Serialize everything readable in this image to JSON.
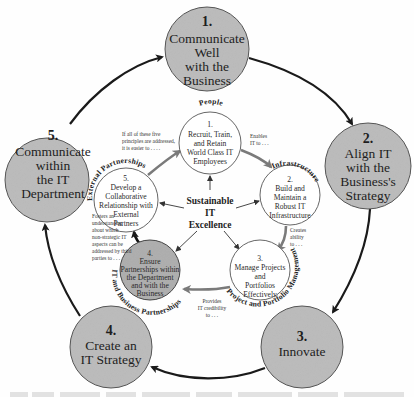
{
  "diagram": {
    "center": {
      "lines": [
        "Sustainable",
        "IT",
        "Excellence"
      ]
    },
    "outer_cycle": [
      {
        "number": "1.",
        "lines": [
          "Communicate",
          "Well",
          "with the",
          "Business"
        ]
      },
      {
        "number": "2.",
        "lines": [
          "Align IT",
          "with the",
          "Business's",
          "Strategy"
        ]
      },
      {
        "number": "3.",
        "lines": [
          "Innovate"
        ]
      },
      {
        "number": "4.",
        "lines": [
          "Create an",
          "IT Strategy"
        ]
      },
      {
        "number": "5.",
        "lines": [
          "Communicate",
          "within",
          "the IT",
          "Department"
        ]
      }
    ],
    "inner_cycle": [
      {
        "number": "1.",
        "lines": [
          "Recruit, Train,",
          "and Retain",
          "World Class IT",
          "Employees"
        ],
        "category": "People"
      },
      {
        "number": "2.",
        "lines": [
          "Build and",
          "Maintain a",
          "Robust IT",
          "Infrastructure"
        ],
        "category": "Infrastructure"
      },
      {
        "number": "3.",
        "lines": [
          "Manage Projects",
          "and",
          "Portfolios",
          "Effectively"
        ],
        "category": "Project and Portfolio Management"
      },
      {
        "number": "4.",
        "lines": [
          "Ensure",
          "Partnerships within",
          "the Department",
          "and with the",
          "Business"
        ],
        "category": "IT and Business Partnerships",
        "highlighted": true
      },
      {
        "number": "5.",
        "lines": [
          "Develop a",
          "Collaborative",
          "Relationship with",
          "External",
          "Partners"
        ],
        "category": "External Partnerships"
      }
    ],
    "connector_notes": [
      {
        "from": "1",
        "to": "2",
        "lines": [
          "Enables",
          "IT to . . ."
        ]
      },
      {
        "from": "2",
        "to": "3",
        "lines": [
          "Creates",
          "ability",
          "to . . ."
        ]
      },
      {
        "from": "3",
        "to": "4",
        "lines": [
          "Provides",
          "IT credibility",
          "to . . ."
        ]
      },
      {
        "from": "4",
        "to": "5",
        "lines": [
          "Fosters an",
          "understanding",
          "about which",
          "non-strategic IT",
          "aspects can be",
          "addressed by third",
          "parties to . . ."
        ]
      },
      {
        "from": "5",
        "to": "1",
        "lines": [
          "If all of these five",
          "principles are addressed,",
          "it is easier to . . . ."
        ]
      }
    ],
    "colors": {
      "outer_fill": "#bdbdbd",
      "inner_highlight_fill": "#b0b0b0",
      "inner_fill": "#ffffff",
      "stroke": "#555555",
      "arrow": "#1a1a1a",
      "inner_arrow": "#7a7a7a"
    }
  }
}
